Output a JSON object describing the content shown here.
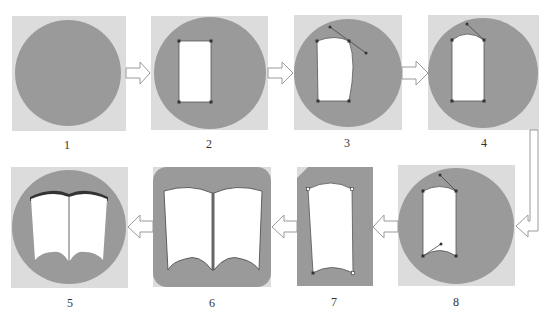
{
  "diagram": {
    "type": "process-flow",
    "colors": {
      "background_square": "#dcdcdc",
      "shape_fill": "#9a9a9a",
      "cutout": "#ffffff",
      "anchor": "#333333",
      "handle_line": "#444444",
      "arrow_stroke": "#9a9a9a",
      "label_text": "#333333"
    },
    "steps": [
      {
        "id": 1,
        "label": "1",
        "desc": "Gray circle on light square"
      },
      {
        "id": 2,
        "label": "2",
        "desc": "White rectangle with four anchor points"
      },
      {
        "id": 3,
        "label": "3",
        "desc": "Top-right anchor curved with bezier handle"
      },
      {
        "id": 4,
        "label": "4",
        "desc": "Arched top edge"
      },
      {
        "id": 5,
        "label": "5",
        "desc": "Final open-book icon in circle"
      },
      {
        "id": 6,
        "label": "6",
        "desc": "Mirrored pages forming open book"
      },
      {
        "id": 7,
        "label": "7",
        "desc": "Single page shape isolated"
      },
      {
        "id": 8,
        "label": "8",
        "desc": "Curved bottom edge added"
      }
    ],
    "flow": [
      "1",
      "2",
      "3",
      "4",
      "8",
      "7",
      "6",
      "5"
    ]
  }
}
